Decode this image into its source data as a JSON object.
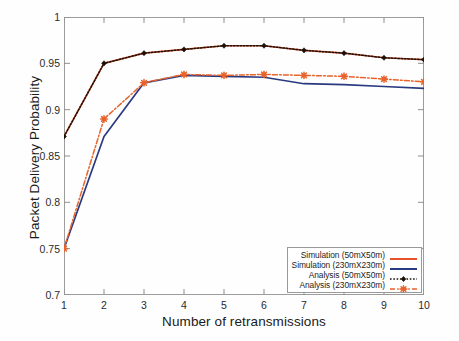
{
  "chart_data": {
    "type": "line",
    "title": "",
    "xlabel": "Number of retransmissions",
    "ylabel": "Packet Delivery Probability",
    "xlim": [
      1,
      10
    ],
    "ylim": [
      0.7,
      1
    ],
    "xticks": [
      "1",
      "2",
      "3",
      "4",
      "5",
      "6",
      "7",
      "8",
      "9",
      "10"
    ],
    "yticks": [
      "0.7",
      "0.75",
      "0.8",
      "0.85",
      "0.9",
      "0.95",
      "1"
    ],
    "grid": false,
    "legend_position": "lower right",
    "x": [
      1,
      2,
      3,
      4,
      5,
      6,
      7,
      8,
      9,
      10
    ],
    "series": [
      {
        "name": "Simulation (50mX50m)",
        "color": "#e8512a",
        "style": "solid",
        "marker": "none",
        "values": [
          0.871,
          0.95,
          0.961,
          0.965,
          0.969,
          0.969,
          0.964,
          0.961,
          0.956,
          0.954
        ]
      },
      {
        "name": "Simulation (230mX230m)",
        "color": "#2a3a80",
        "style": "solid",
        "marker": "none",
        "values": [
          0.75,
          0.871,
          0.929,
          0.937,
          0.936,
          0.935,
          0.928,
          0.927,
          0.925,
          0.923
        ]
      },
      {
        "name": "Analysis (50mX50m)",
        "color": "#1a1008",
        "style": "dotted",
        "marker": "diamond",
        "values": [
          0.871,
          0.95,
          0.961,
          0.965,
          0.969,
          0.969,
          0.964,
          0.961,
          0.956,
          0.954
        ]
      },
      {
        "name": "Analysis (230mX230m)",
        "color": "#e8622a",
        "style": "dashdot",
        "marker": "star",
        "values": [
          0.75,
          0.89,
          0.929,
          0.938,
          0.937,
          0.938,
          0.937,
          0.936,
          0.933,
          0.93
        ]
      }
    ]
  },
  "legend": {
    "entries": [
      {
        "label": "Simulation (50mX50m)"
      },
      {
        "label": "Simulation (230mX230m)"
      },
      {
        "label": "Analysis (50mX50m)"
      },
      {
        "label": "Analysis (230mX230m)"
      }
    ]
  }
}
